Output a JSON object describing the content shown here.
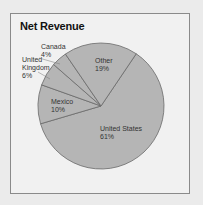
{
  "chart_data": {
    "type": "pie",
    "title": "Net Revenue",
    "categories": [
      "United States",
      "Mexico",
      "United Kingdom",
      "Canada",
      "Other"
    ],
    "values": [
      61,
      10,
      6,
      4,
      19
    ],
    "unit": "%",
    "labels": [
      {
        "name": "United States",
        "value": "61%"
      },
      {
        "name": "Mexico",
        "value": "10%"
      },
      {
        "name": "United Kingdom",
        "value": "6%"
      },
      {
        "name": "Canada",
        "value": "4%"
      },
      {
        "name": "Other",
        "value": "19%"
      }
    ],
    "colors": {
      "slice_fill": "#b5b5b5",
      "slice_stroke": "#6a6a6a",
      "background": "#ebebeb",
      "frame_fill": "#f1f1f1"
    },
    "start_angle_deg": 34,
    "legend": "none"
  },
  "labels": {
    "us_name": "United States",
    "us_value": "61%",
    "mx_name": "Mexico",
    "mx_value": "10%",
    "uk_name1": "United",
    "uk_name2": "Kingdom",
    "uk_value": "6%",
    "ca_name": "Canada",
    "ca_value": "4%",
    "ot_name": "Other",
    "ot_value": "19%"
  }
}
